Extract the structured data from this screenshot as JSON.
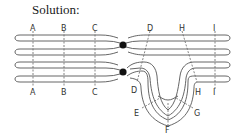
{
  "title": "Solution:",
  "diagram": {
    "type": "chromosome pairing with inversion loop",
    "top_chromosome": {
      "labels": [
        "A",
        "B",
        "C",
        "D",
        "H",
        "I"
      ]
    },
    "bottom_chromosome": {
      "labels": [
        "A",
        "B",
        "C",
        "D",
        "H",
        "I"
      ]
    },
    "loop_labels": [
      "E",
      "F",
      "G"
    ],
    "centromere_color": "#111111",
    "line_color": "#555555"
  }
}
